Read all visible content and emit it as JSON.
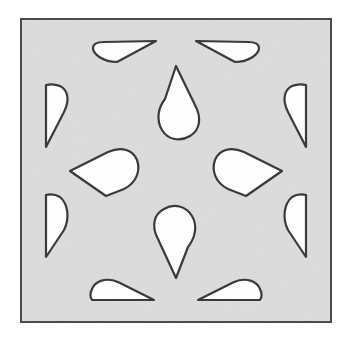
{
  "figure": {
    "canvas": {
      "width": 357,
      "height": 353
    },
    "background_color": "#ffffff"
  },
  "tile": {
    "name": "square-tile",
    "x": 21,
    "y": 19,
    "width": 310,
    "height": 303,
    "fill_color": "#dcdcdc",
    "stroke_color": "#4a4a4a",
    "stroke_width": 2
  },
  "shape_style": {
    "fill_color": "#fdfdfd",
    "stroke_color": "#3a3a3a",
    "stroke_width": 2.2
  },
  "shapes": [
    {
      "name": "teardrop-top-edge-left",
      "type": "half-teardrop",
      "orientation": "point-right",
      "position": "top-edge-left",
      "path": "M 104 42 L 156 41 L 117 62 C 103 62 93 54 93 48 C 93 44 97 42 104 42 Z"
    },
    {
      "name": "teardrop-top-edge-right",
      "type": "half-teardrop",
      "orientation": "point-left",
      "position": "top-edge-right",
      "path": "M 248 42 L 196 41 L 235 62 C 249 62 259 54 259 48 C 259 44 255 42 248 42 Z"
    },
    {
      "name": "teardrop-center-top",
      "type": "full-teardrop",
      "orientation": "point-up",
      "position": "center-upper",
      "path": "M 176 66 L 195 105 C 202 118 200 130 190 136 C 180 142 168 140 162 130 C 156 120 158 108 165 99 Z"
    },
    {
      "name": "teardrop-left-edge-upper",
      "type": "half-teardrop",
      "orientation": "point-down",
      "position": "left-edge-upper",
      "path": "M 46 85 L 46 147 L 64 112 C 70 100 68 90 60 86 C 55 84 50 84 46 85 Z"
    },
    {
      "name": "teardrop-right-edge-upper",
      "type": "half-teardrop",
      "orientation": "point-down",
      "position": "right-edge-upper",
      "path": "M 306 85 L 306 147 L 288 112 C 282 100 284 90 292 86 C 297 84 302 84 306 85 Z"
    },
    {
      "name": "teardrop-middle-left",
      "type": "full-teardrop",
      "orientation": "point-left",
      "position": "middle-left",
      "path": "M 70 171 L 108 152 C 122 146 133 150 137 160 C 141 171 136 183 124 189 L 106 196 Z"
    },
    {
      "name": "teardrop-middle-right",
      "type": "full-teardrop",
      "orientation": "point-right",
      "position": "middle-right",
      "path": "M 282 171 L 244 152 C 230 146 219 150 215 160 C 211 171 216 183 228 189 L 246 196 Z"
    },
    {
      "name": "teardrop-left-edge-lower",
      "type": "half-teardrop",
      "orientation": "point-up",
      "position": "left-edge-lower",
      "path": "M 46 195 L 46 257 L 64 230 C 70 218 68 204 60 197 C 55 194 50 194 46 195 Z"
    },
    {
      "name": "teardrop-right-edge-lower",
      "type": "half-teardrop",
      "orientation": "point-up",
      "position": "right-edge-lower",
      "path": "M 306 195 L 306 257 L 288 230 C 282 218 284 204 292 197 C 297 194 302 194 306 195 Z"
    },
    {
      "name": "teardrop-center-bottom",
      "type": "full-teardrop",
      "orientation": "point-down",
      "position": "center-lower",
      "path": "M 176 278 L 158 239 C 151 226 154 214 164 209 C 174 203 186 206 192 216 C 198 226 195 238 188 247 Z"
    },
    {
      "name": "teardrop-bottom-edge-left",
      "type": "half-teardrop",
      "orientation": "point-right",
      "position": "bottom-edge-left",
      "path": "M 92 300 L 154 300 L 118 282 C 106 277 95 281 92 289 C 90 293 90 297 92 300 Z"
    },
    {
      "name": "teardrop-bottom-edge-right",
      "type": "half-teardrop",
      "orientation": "point-left",
      "position": "bottom-edge-right",
      "path": "M 260 300 L 198 300 L 234 282 C 246 277 257 281 260 289 C 262 293 262 297 260 300 Z"
    }
  ]
}
